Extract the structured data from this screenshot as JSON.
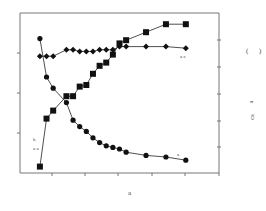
{
  "chart_data": {
    "type": "line",
    "title": "",
    "xlabel": "a",
    "ylabel_left": "",
    "ylabel_right": "( )  a  ca",
    "grid": false,
    "legend": "none (inline annotations)",
    "annotations": [
      {
        "text": "a  c",
        "near": "diamond series end"
      },
      {
        "text": "h",
        "near": "square series start"
      },
      {
        "text": "a  a",
        "near": "square series start"
      },
      {
        "text": "a",
        "near": "circle series end"
      }
    ],
    "x": [
      1,
      2,
      3,
      5,
      6,
      7,
      8,
      9,
      10,
      11,
      12,
      13,
      14,
      17,
      20,
      23
    ],
    "series": [
      {
        "name": "diamonds",
        "marker": "diamond",
        "values": [
          0.73,
          0.73,
          0.73,
          0.77,
          0.77,
          0.76,
          0.76,
          0.76,
          0.77,
          0.77,
          0.77,
          0.79,
          0.79,
          0.79,
          0.79,
          0.78
        ]
      },
      {
        "name": "squares",
        "marker": "square",
        "values": [
          0.04,
          0.34,
          0.39,
          0.48,
          0.48,
          0.54,
          0.55,
          0.62,
          0.67,
          0.69,
          0.74,
          0.81,
          0.83,
          0.88,
          0.93,
          0.93
        ]
      },
      {
        "name": "circles",
        "marker": "circle",
        "values": [
          0.84,
          0.6,
          0.53,
          0.44,
          0.33,
          0.29,
          0.26,
          0.22,
          0.19,
          0.17,
          0.16,
          0.15,
          0.13,
          0.11,
          0.1,
          0.08
        ]
      }
    ],
    "ylim": [
      0,
      1
    ],
    "xlim": [
      -2,
      28
    ]
  },
  "labels": {
    "x_axis": "a",
    "right_paren_open": "(",
    "right_paren_close": ")",
    "right_a": "a",
    "right_ca": "ca",
    "annot_diamond": "a  c",
    "annot_square_h": "h",
    "annot_square_aa": "a  a",
    "annot_circle": "a"
  }
}
